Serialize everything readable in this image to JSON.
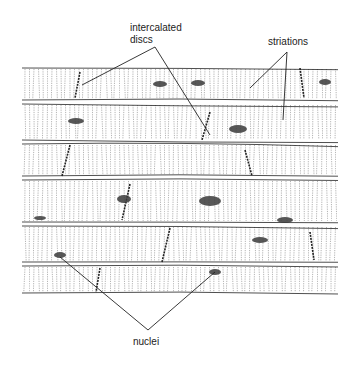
{
  "figure": {
    "labels": {
      "intercalated_discs_line1": "intercalated",
      "intercalated_discs_line2": "discs",
      "striations": "striations",
      "nuclei": "nuclei"
    },
    "colors": {
      "ink": "#222222",
      "background": "#ffffff",
      "nucleus": "#3a3a3a"
    }
  }
}
